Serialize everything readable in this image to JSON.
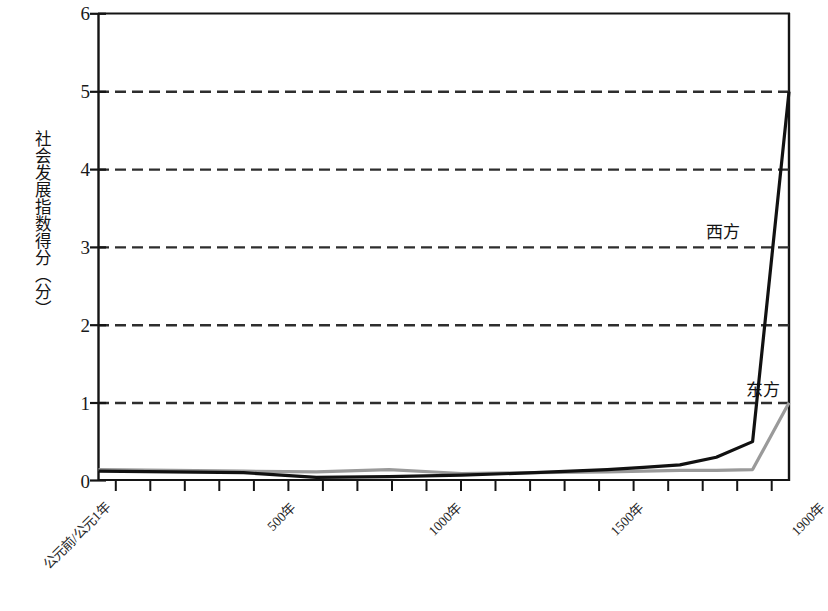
{
  "chart_data": {
    "type": "line",
    "title": "",
    "xlabel": "",
    "ylabel": "社会发展指数得分（分）",
    "ylim": [
      0,
      6
    ],
    "yticks": [
      0,
      1,
      2,
      3,
      4,
      5,
      6
    ],
    "ytick_labels": [
      "0",
      "1",
      "2",
      "3",
      "4",
      "5",
      "6"
    ],
    "grid": true,
    "grid_style": "dashed-horizontal",
    "xtick_labels": [
      "公元前/公元1年",
      "500年",
      "1000年",
      "1500年",
      "1900年"
    ],
    "xtick_values": [
      1,
      500,
      1000,
      1500,
      1900
    ],
    "xlim": [
      1,
      1900
    ],
    "legend_position": "inline-annotation",
    "series": [
      {
        "name": "西方",
        "color": "#111111",
        "linewidth": 3,
        "x": [
          1,
          200,
          400,
          600,
          800,
          1000,
          1200,
          1400,
          1500,
          1600,
          1700,
          1800,
          1900
        ],
        "values": [
          0.12,
          0.11,
          0.1,
          0.04,
          0.05,
          0.07,
          0.1,
          0.14,
          0.17,
          0.2,
          0.3,
          0.5,
          5.0
        ]
      },
      {
        "name": "东方",
        "color": "#9a9a9a",
        "linewidth": 3,
        "x": [
          1,
          200,
          400,
          600,
          800,
          1000,
          1200,
          1400,
          1500,
          1600,
          1700,
          1800,
          1900
        ],
        "values": [
          0.14,
          0.13,
          0.12,
          0.11,
          0.14,
          0.09,
          0.1,
          0.11,
          0.12,
          0.13,
          0.13,
          0.14,
          1.0
        ]
      }
    ]
  },
  "axes": {
    "y_title": "社会发展指数得分（分）",
    "y_labels": [
      "6",
      "5",
      "4",
      "3",
      "2",
      "1",
      "0"
    ],
    "x_labels": [
      "公元前/公元1年",
      "500年",
      "1000年",
      "1500年",
      "1900年"
    ]
  },
  "annotations": {
    "west": "西方",
    "east": "东方"
  },
  "colors": {
    "west_line": "#111111",
    "east_line": "#9a9a9a",
    "axis": "#141414",
    "grid": "#333333",
    "background": "#ffffff"
  }
}
